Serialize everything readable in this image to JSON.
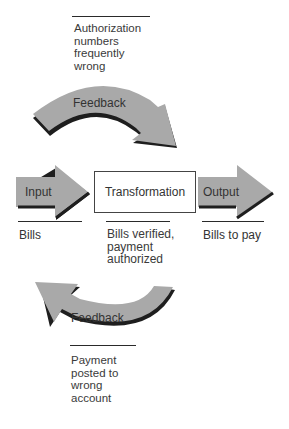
{
  "diagram": {
    "top_feedback": {
      "label": "Feedback",
      "note": "Authorization\nnumbers\nfrequently\nwrong"
    },
    "input": {
      "label": "Input",
      "caption": "Bills"
    },
    "transformation": {
      "label": "Transformation",
      "caption": "Bills verified,\npayment\nauthorized"
    },
    "output": {
      "label": "Output",
      "caption": "Bills to pay"
    },
    "bottom_feedback": {
      "label": "Feedback",
      "note": "Payment\nposted to\nwrong\naccount"
    },
    "colors": {
      "arrow_fill": "#a9a9a9",
      "arrow_shadow": "#1e1e1e",
      "line": "#2a2a2a",
      "text": "#333333"
    }
  }
}
